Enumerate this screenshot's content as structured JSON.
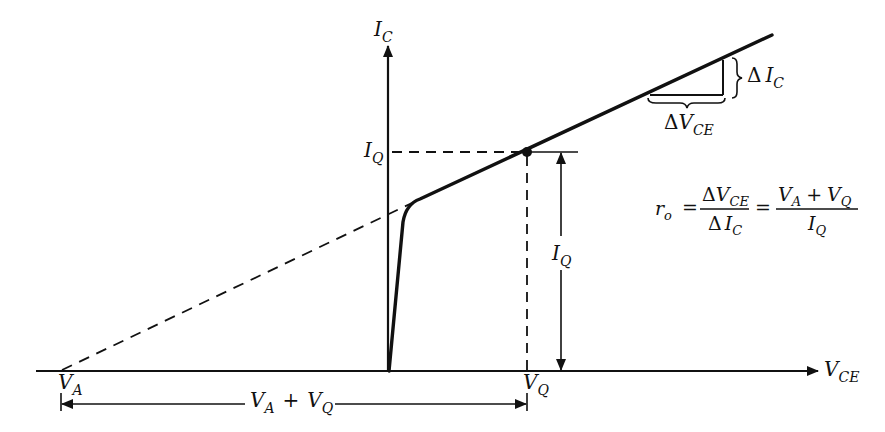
{
  "diagram": {
    "colors": {
      "ink": "#111111",
      "background": "#ffffff"
    },
    "axes": {
      "y_axis": {
        "main": "I",
        "sub": "C"
      },
      "x_axis": {
        "main": "V",
        "sub": "CE"
      }
    },
    "labels": {
      "iq_left": {
        "main": "I",
        "sub": "Q"
      },
      "iq_dim": {
        "main": "I",
        "sub": "Q"
      },
      "va": {
        "main": "V",
        "sub": "A"
      },
      "vq": {
        "main": "V",
        "sub": "Q"
      },
      "va_plus_vq": {
        "a_main": "V",
        "a_sub": "A",
        "plus": "+",
        "b_main": "V",
        "b_sub": "Q"
      },
      "delta_ic": {
        "delta": "Δ",
        "main": "I",
        "sub": "C"
      },
      "delta_vce": {
        "delta": "Δ",
        "main": "V",
        "sub": "CE"
      }
    },
    "equation": {
      "lhs": {
        "main": "r",
        "sub": "o"
      },
      "eq1": "=",
      "frac1_num": {
        "delta": "Δ",
        "main": "V",
        "sub": "CE"
      },
      "frac1_den": {
        "delta": "Δ",
        "main": "I",
        "sub": "C"
      },
      "eq2": "=",
      "frac2_num": {
        "a_main": "V",
        "a_sub": "A",
        "plus": "+",
        "b_main": "V",
        "b_sub": "Q"
      },
      "frac2_den": {
        "main": "I",
        "sub": "Q"
      }
    },
    "geometry": {
      "x_axis_y": 371,
      "y_axis_x": 388,
      "va_x": 60,
      "vq_x": 527,
      "q_point": [
        527,
        152
      ],
      "knee_point": [
        415,
        202
      ],
      "line_end": [
        772,
        35
      ]
    }
  }
}
